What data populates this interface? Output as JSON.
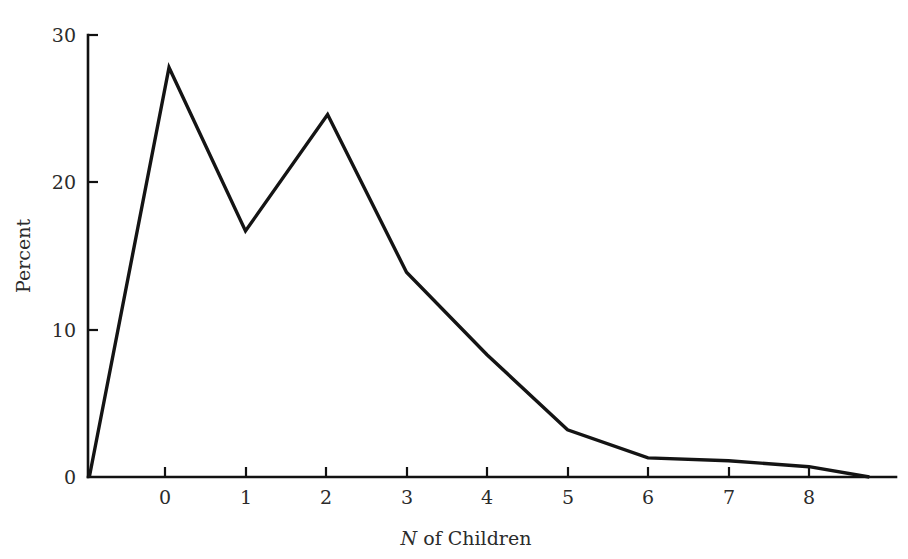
{
  "chart_data": {
    "type": "line",
    "title": "",
    "subtitle": "",
    "xlabel_prefix": "N",
    "xlabel_rest": " of Children",
    "xlabel": "N of Children",
    "ylabel": "Percent",
    "xlim": [
      -1.0,
      9.1
    ],
    "ylim": [
      0,
      30
    ],
    "grid": false,
    "legend": null,
    "x_ticks": [
      0,
      1,
      2,
      3,
      4,
      5,
      6,
      7,
      8
    ],
    "x_tick_labels": [
      "0",
      "1",
      "2",
      "3",
      "4",
      "5",
      "6",
      "7",
      "8"
    ],
    "y_ticks": [
      0,
      10,
      20,
      30
    ],
    "y_tick_labels": [
      "0",
      "10",
      "20",
      "30"
    ],
    "series": [
      {
        "name": "Percent of families",
        "color": "#141414",
        "x": [
          -0.94,
          0.05,
          1.0,
          2.02,
          3.0,
          4.0,
          5.0,
          6.0,
          7.0,
          8.0,
          8.75
        ],
        "y": [
          0.0,
          27.8,
          16.7,
          24.6,
          13.9,
          8.3,
          3.2,
          1.3,
          1.1,
          0.7,
          0.0
        ]
      }
    ],
    "points_readout": [
      {
        "x": "0",
        "percent": "27.8"
      },
      {
        "x": "1",
        "percent": "16.7"
      },
      {
        "x": "2",
        "percent": "24.6"
      },
      {
        "x": "3",
        "percent": "13.9"
      },
      {
        "x": "4",
        "percent": "8.3"
      },
      {
        "x": "5",
        "percent": "3.2"
      },
      {
        "x": "6",
        "percent": "1.3"
      },
      {
        "x": "7",
        "percent": "1.1"
      },
      {
        "x": "8",
        "percent": "0.7"
      }
    ]
  },
  "axes": {
    "y_labels": {
      "t0": "0",
      "t10": "10",
      "t20": "20",
      "t30": "30"
    },
    "x_labels": {
      "t0": "0",
      "t1": "1",
      "t2": "2",
      "t3": "3",
      "t4": "4",
      "t5": "5",
      "t6": "6",
      "t7": "7",
      "t8": "8"
    },
    "y_title": "Percent",
    "x_title_italic": "N",
    "x_title_rest": " of Children"
  },
  "colors": {
    "background": "#ffffff",
    "axis": "#111111",
    "line": "#141414",
    "text": "#2b2b2b"
  }
}
